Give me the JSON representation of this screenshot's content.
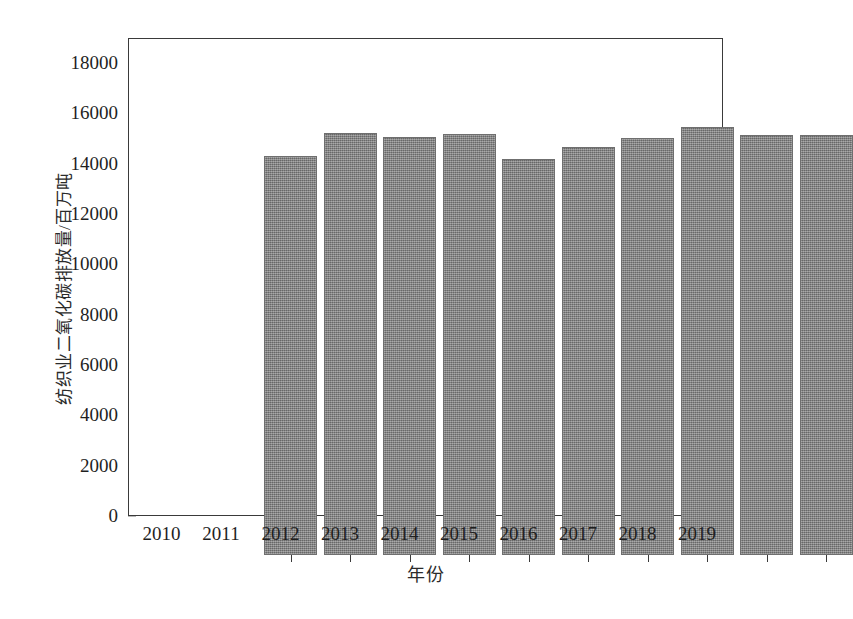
{
  "chart_data": {
    "type": "bar",
    "title": "",
    "xlabel": "年份",
    "ylabel": "纺织业二氧化碳排放量/百万吨",
    "categories": [
      "2010",
      "2011",
      "2012",
      "2013",
      "2014",
      "2015",
      "2016",
      "2017",
      "2018",
      "2019"
    ],
    "values": [
      15880,
      16760,
      16620,
      16730,
      15750,
      16200,
      16570,
      17020,
      16680,
      16700
    ],
    "series": [
      {
        "name": "纺织业二氧化碳排放量",
        "values": [
          15880,
          16760,
          16620,
          16730,
          15750,
          16200,
          16570,
          17020,
          16680,
          16700
        ]
      }
    ],
    "ylim": [
      0,
      19000
    ],
    "y_ticks": [
      0,
      2000,
      4000,
      6000,
      8000,
      10000,
      12000,
      14000,
      16000,
      18000
    ],
    "y_tick_labels": [
      "0",
      "2000",
      "4000",
      "6000",
      "8000",
      "10000",
      "12000",
      "14000",
      "16000",
      "18000"
    ],
    "x_tick_labels": [
      "2010",
      "2011",
      "2012",
      "2013",
      "2014",
      "2015",
      "2016",
      "2017",
      "2018",
      "2019"
    ],
    "grid": false,
    "legend": null,
    "legend_position": "none",
    "bar_color": "#7e7e7e",
    "axis_color": "#3a3a3a",
    "background_color": "#ffffff"
  },
  "figure": {
    "caption": ""
  }
}
